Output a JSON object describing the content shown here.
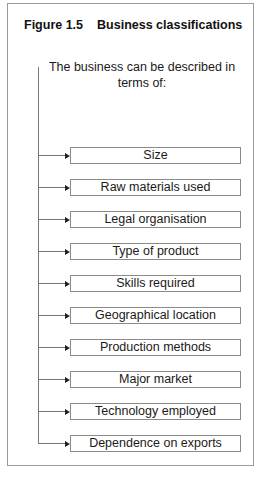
{
  "figure": {
    "number": "Figure 1.5",
    "title": "Business classifications"
  },
  "intro_text": "The business can be described in terms of:",
  "classifications": [
    {
      "label": "Size"
    },
    {
      "label": "Raw materials used"
    },
    {
      "label": "Legal organisation"
    },
    {
      "label": "Type of product"
    },
    {
      "label": "Skills required"
    },
    {
      "label": "Geographical location"
    },
    {
      "label": "Production methods"
    },
    {
      "label": "Major market"
    },
    {
      "label": "Technology employed"
    },
    {
      "label": "Dependence on exports"
    }
  ],
  "colors": {
    "frame": "#9a9a9a",
    "connector": "#777777",
    "arrowhead": "#222222",
    "box_border": "#8a8a8a",
    "text": "#1a1a1a"
  }
}
